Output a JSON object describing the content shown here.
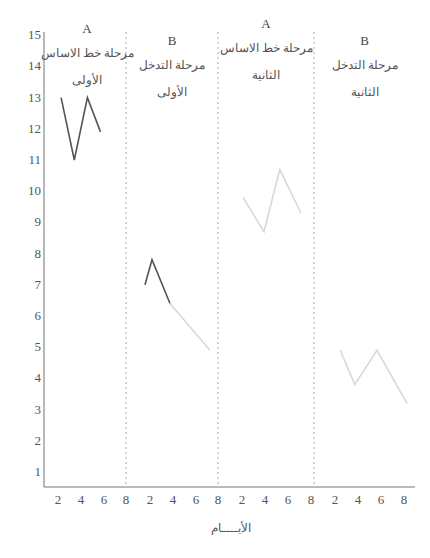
{
  "chart_data": {
    "type": "line",
    "title": "",
    "xlabel": "الأيــــام",
    "ylabel": "",
    "ylim": [
      1,
      15
    ],
    "yticks": [
      1,
      2,
      3,
      4,
      5,
      6,
      7,
      8,
      9,
      10,
      11,
      12,
      13,
      14,
      15
    ],
    "xtick_labels": [
      "2",
      "4",
      "6",
      "8",
      "2",
      "4",
      "6",
      "8",
      "2",
      "4",
      "6",
      "8",
      "2",
      "4",
      "6",
      "8"
    ],
    "grid": false,
    "legend": null,
    "phases": [
      {
        "letter": "A",
        "label_line1": "مرحلة خط الاساس",
        "label_line2": "الأولى"
      },
      {
        "letter": "B",
        "label_line1": "مرحلة التدخل",
        "label_line2": "الأولى"
      },
      {
        "letter": "A",
        "label_line1": "مرحلة خط الاساس",
        "label_line2": "الثانية"
      },
      {
        "letter": "B",
        "label_line1": "مرحلة التدخل",
        "label_line2": "الثانية"
      }
    ],
    "series": [
      {
        "name": "Baseline 1 (A)",
        "color": "#555555",
        "x": [
          1.5,
          3,
          4.5,
          6
        ],
        "values": [
          13,
          11,
          13,
          11.9
        ]
      },
      {
        "name": "Intervention 1 (B)",
        "color": "#555555",
        "x": [
          1.5,
          2.2,
          4,
          8
        ],
        "values": [
          7,
          7.8,
          6.4,
          4.9
        ]
      },
      {
        "name": "Baseline 2 (A)",
        "color": "#d8d8d8",
        "x": [
          2,
          4,
          5.5,
          7.5
        ],
        "values": [
          9.8,
          8.7,
          10.7,
          9.3
        ]
      },
      {
        "name": "Intervention 2 (B)",
        "color": "#d8d8d8",
        "x": [
          2,
          3.3,
          5.3,
          8
        ],
        "values": [
          4.9,
          3.8,
          4.9,
          3.2
        ]
      }
    ]
  }
}
